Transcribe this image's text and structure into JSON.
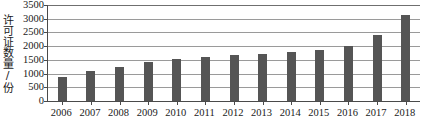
{
  "chart_data": {
    "type": "bar",
    "title": "",
    "xlabel": "",
    "ylabel": "许可证数量/份",
    "categories": [
      "2006",
      "2007",
      "2008",
      "2009",
      "2010",
      "2011",
      "2012",
      "2013",
      "2014",
      "2015",
      "2016",
      "2017",
      "2018"
    ],
    "values": [
      870,
      1100,
      1250,
      1420,
      1520,
      1600,
      1670,
      1700,
      1800,
      1870,
      2020,
      2400,
      3150
    ],
    "ylim": [
      0,
      3500
    ],
    "yticks": [
      0,
      500,
      1000,
      1500,
      2000,
      2500,
      3000,
      3500
    ],
    "ytick_labels": [
      "0",
      "500",
      "1000",
      "1500",
      "2000",
      "2500",
      "3000",
      "3500"
    ],
    "grid": true,
    "legend": false,
    "series": [
      {
        "name": "许可证数量",
        "values": [
          870,
          1100,
          1250,
          1420,
          1520,
          1600,
          1670,
          1700,
          1800,
          1870,
          2020,
          2400,
          3150
        ]
      }
    ],
    "colors": {
      "bar": "#555555",
      "gridline": "#9a9a9a",
      "axis": "#4a4a4a",
      "text": "#1a1a1a",
      "background": "#ffffff"
    }
  }
}
